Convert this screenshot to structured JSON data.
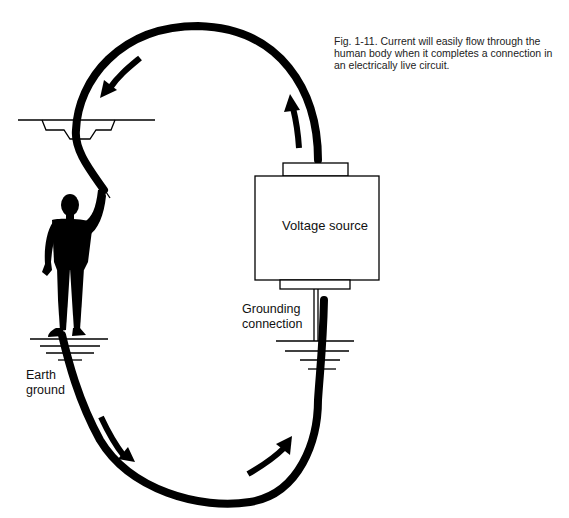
{
  "caption": {
    "text": "Fig. 1-11. Current will easily flow through the human body when it completes a connection in an electrically live circuit."
  },
  "labels": {
    "voltage_source": "Voltage source",
    "grounding_line1": "Grounding",
    "grounding_line2": "connection",
    "earth_line1": "Earth",
    "earth_line2": "ground"
  },
  "icons": {
    "figure": "human-silhouette-icon",
    "ground": "ground-symbol-icon",
    "arrow": "current-flow-arrow-icon"
  },
  "colors": {
    "ink": "#000000",
    "background": "#ffffff",
    "text": "#222222"
  }
}
